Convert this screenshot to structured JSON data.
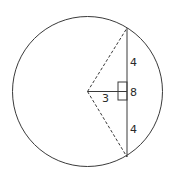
{
  "diagram": {
    "type": "circle-chord-geometry",
    "colors": {
      "stroke": "#3a3a3a",
      "background": "#ffffff",
      "text": "#2a2a2a"
    },
    "circle": {
      "cx": 87.5,
      "cy": 91.5,
      "r": 75
    },
    "chord": {
      "x": 127,
      "y1": 28,
      "y2": 157,
      "length_label": "8"
    },
    "perpendicular": {
      "from": [
        87.5,
        91.5
      ],
      "to": [
        127,
        91.5
      ],
      "length_label": "3"
    },
    "radii_dashed": [
      {
        "from": [
          87.5,
          91.5
        ],
        "to": [
          127,
          28
        ]
      },
      {
        "from": [
          87.5,
          91.5
        ],
        "to": [
          127,
          157
        ]
      }
    ],
    "right_angle_marker": {
      "x": 118,
      "y": 82,
      "w": 9,
      "h": 18
    },
    "labels": {
      "upper_half": "4",
      "chord_total": "8",
      "distance": "3",
      "lower_half": "4"
    }
  }
}
